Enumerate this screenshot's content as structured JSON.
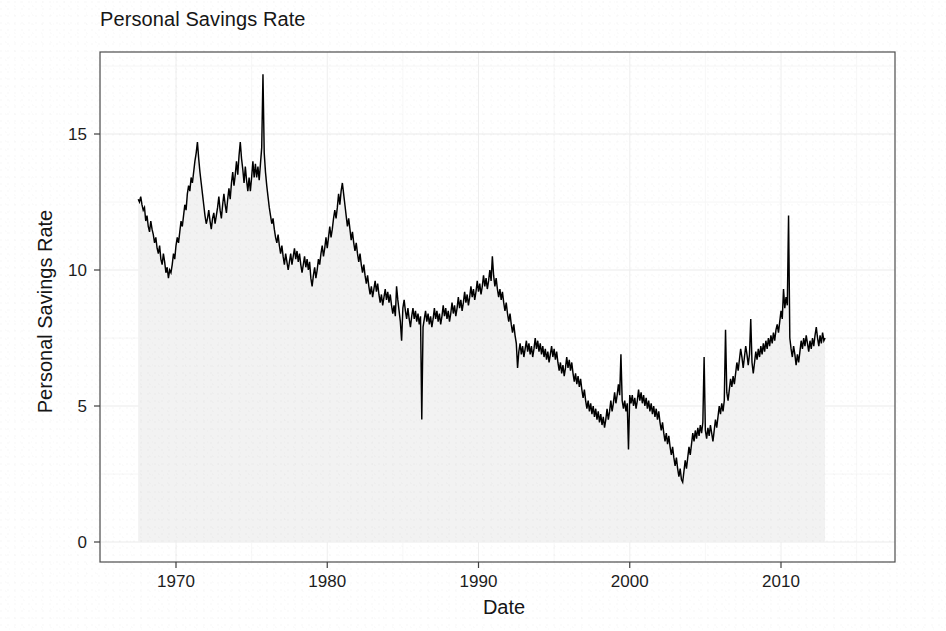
{
  "chart_data": {
    "type": "area",
    "title": "Personal Savings Rate",
    "xlabel": "Date",
    "ylabel": "Personal Savings Rate",
    "x_tick_labels": [
      "1970",
      "1980",
      "1990",
      "2000",
      "2010"
    ],
    "x_ticks": [
      1970,
      1980,
      1990,
      2000,
      2010
    ],
    "y_tick_labels": [
      "0",
      "5",
      "10",
      "15"
    ],
    "y_ticks": [
      0,
      5,
      10,
      15
    ],
    "xlim": [
      1966.6,
      2016.2
    ],
    "ylim": [
      -0.4,
      18.0
    ],
    "grid": true,
    "legend": "none",
    "line_color": "#000000",
    "fill_color": "#f2f2f2",
    "panel_border_color": "#4a4a4a",
    "series": [
      {
        "name": "Personal Savings Rate",
        "x_start": 1967.5,
        "x_end": 2015.42,
        "x_step": 0.0833333,
        "frequency": "monthly",
        "values": [
          12.6,
          12.5,
          12.7,
          12.4,
          12.2,
          12.3,
          11.8,
          12.0,
          11.6,
          11.4,
          11.8,
          11.5,
          11.3,
          11.0,
          11.2,
          10.8,
          10.6,
          10.9,
          10.4,
          10.2,
          10.6,
          10.3,
          9.9,
          10.1,
          9.7,
          10.0,
          9.9,
          10.2,
          10.6,
          10.4,
          10.9,
          11.2,
          11.0,
          11.4,
          11.8,
          11.6,
          12.0,
          12.4,
          12.2,
          12.8,
          13.1,
          12.9,
          13.4,
          13.2,
          13.6,
          14.0,
          14.3,
          14.7,
          14.1,
          13.6,
          13.2,
          12.8,
          12.4,
          12.0,
          11.7,
          11.9,
          12.2,
          11.8,
          11.5,
          11.9,
          12.1,
          11.7,
          12.0,
          12.3,
          12.7,
          12.2,
          11.9,
          12.4,
          12.8,
          12.4,
          12.1,
          12.6,
          13.0,
          12.6,
          13.2,
          13.6,
          13.1,
          13.5,
          14.0,
          13.5,
          14.2,
          14.7,
          14.1,
          13.7,
          13.2,
          13.8,
          13.3,
          12.9,
          13.4,
          12.9,
          13.4,
          14.0,
          13.4,
          13.9,
          13.4,
          13.8,
          13.3,
          13.9,
          14.5,
          17.2,
          14.3,
          13.6,
          13.1,
          12.7,
          12.3,
          12.0,
          11.7,
          11.9,
          11.5,
          11.2,
          11.0,
          11.3,
          10.9,
          10.6,
          10.9,
          10.5,
          10.2,
          10.6,
          10.3,
          10.0,
          10.3,
          10.6,
          10.2,
          10.5,
          10.8,
          10.4,
          10.7,
          10.3,
          10.6,
          10.2,
          9.9,
          10.2,
          10.5,
          10.1,
          10.4,
          10.0,
          10.3,
          9.7,
          9.4,
          9.8,
          10.1,
          9.7,
          10.0,
          10.4,
          10.2,
          10.6,
          10.9,
          10.5,
          10.8,
          11.2,
          10.8,
          11.2,
          11.6,
          11.2,
          11.5,
          11.9,
          12.2,
          11.9,
          12.3,
          12.8,
          12.4,
          12.9,
          13.2,
          12.8,
          12.4,
          12.0,
          11.6,
          11.9,
          11.5,
          11.1,
          11.4,
          11.0,
          10.7,
          11.0,
          10.6,
          10.3,
          10.6,
          10.2,
          9.9,
          10.2,
          9.8,
          9.5,
          9.8,
          9.4,
          9.1,
          9.4,
          9.0,
          9.3,
          9.6,
          9.2,
          9.5,
          9.1,
          8.8,
          9.1,
          8.7,
          9.0,
          9.3,
          8.9,
          9.2,
          8.8,
          9.1,
          8.7,
          8.4,
          8.7,
          8.3,
          9.4,
          8.9,
          8.5,
          8.1,
          7.4,
          8.6,
          8.9,
          8.5,
          8.2,
          8.6,
          8.2,
          7.9,
          8.3,
          8.6,
          8.2,
          8.5,
          8.1,
          8.4,
          8.0,
          8.3,
          4.5,
          7.9,
          8.2,
          8.5,
          8.1,
          8.4,
          8.0,
          8.3,
          7.9,
          8.2,
          8.6,
          8.2,
          8.5,
          8.1,
          8.4,
          8.0,
          8.3,
          8.7,
          8.3,
          8.6,
          8.2,
          8.5,
          8.1,
          8.4,
          8.8,
          8.4,
          8.7,
          8.3,
          8.6,
          9.0,
          8.6,
          8.9,
          8.5,
          8.8,
          9.2,
          8.8,
          9.1,
          8.7,
          9.0,
          9.4,
          9.0,
          9.3,
          8.9,
          9.2,
          9.6,
          9.2,
          9.5,
          9.1,
          9.4,
          9.8,
          9.4,
          9.7,
          9.3,
          9.6,
          10.0,
          9.6,
          10.5,
          9.8,
          9.4,
          9.7,
          9.3,
          9.0,
          9.3,
          8.9,
          9.2,
          8.8,
          8.5,
          8.8,
          8.4,
          8.1,
          8.4,
          8.0,
          7.7,
          8.0,
          7.6,
          7.3,
          6.4,
          7.0,
          7.3,
          6.9,
          7.2,
          6.8,
          7.1,
          7.4,
          7.0,
          7.3,
          6.9,
          7.2,
          6.8,
          7.1,
          7.5,
          7.1,
          7.4,
          7.0,
          7.3,
          6.9,
          7.2,
          6.8,
          7.1,
          6.7,
          7.0,
          6.6,
          6.9,
          7.2,
          6.8,
          7.1,
          6.7,
          7.0,
          6.6,
          6.3,
          6.6,
          6.2,
          6.5,
          6.1,
          6.4,
          6.8,
          6.4,
          6.7,
          6.3,
          6.6,
          6.2,
          5.9,
          6.2,
          5.8,
          6.1,
          5.7,
          6.0,
          5.6,
          5.3,
          5.6,
          5.2,
          4.9,
          5.2,
          4.8,
          5.1,
          4.7,
          5.0,
          4.6,
          4.9,
          4.5,
          4.8,
          4.4,
          4.7,
          4.3,
          4.6,
          4.2,
          4.5,
          4.9,
          4.5,
          4.8,
          5.2,
          4.8,
          5.1,
          5.5,
          5.1,
          5.4,
          5.8,
          5.4,
          6.9,
          5.2,
          4.9,
          5.2,
          4.8,
          5.1,
          3.4,
          5.4,
          5.1,
          5.4,
          5.0,
          5.3,
          4.9,
          5.2,
          5.6,
          5.2,
          5.5,
          5.1,
          5.4,
          5.0,
          5.3,
          4.9,
          5.2,
          4.8,
          5.1,
          4.7,
          5.0,
          4.6,
          4.9,
          4.5,
          4.8,
          4.4,
          4.1,
          4.4,
          4.0,
          3.7,
          4.0,
          3.6,
          3.9,
          3.5,
          3.2,
          3.5,
          3.1,
          2.8,
          3.1,
          2.7,
          2.4,
          2.7,
          2.3,
          2.2,
          2.6,
          3.0,
          2.7,
          3.1,
          3.5,
          3.2,
          3.6,
          4.0,
          3.7,
          4.1,
          3.8,
          4.2,
          3.9,
          4.3,
          4.0,
          4.4,
          6.8,
          4.1,
          3.8,
          4.2,
          3.9,
          4.3,
          4.0,
          3.7,
          4.1,
          4.5,
          4.2,
          4.6,
          5.0,
          4.7,
          5.1,
          4.8,
          5.2,
          7.8,
          5.5,
          5.2,
          5.6,
          6.0,
          5.7,
          6.1,
          5.8,
          6.2,
          6.6,
          6.3,
          6.7,
          7.1,
          6.8,
          6.4,
          6.8,
          7.2,
          6.9,
          6.5,
          6.9,
          8.2,
          6.6,
          6.2,
          6.6,
          7.0,
          6.7,
          7.1,
          6.8,
          7.2,
          6.9,
          7.3,
          7.0,
          7.4,
          7.1,
          7.5,
          7.2,
          7.6,
          7.3,
          7.7,
          7.4,
          7.8,
          8.0,
          7.7,
          8.1,
          8.5,
          8.2,
          9.3,
          8.6,
          9.0,
          8.7,
          12.0,
          7.5,
          7.1,
          6.8,
          7.2,
          6.9,
          6.5,
          6.9,
          6.6,
          7.0,
          7.4,
          7.1,
          7.5,
          7.2,
          7.6,
          7.3,
          7.0,
          7.4,
          7.1,
          7.5,
          7.2,
          7.6,
          7.9,
          7.5,
          7.2,
          7.6,
          7.3,
          7.7,
          7.4,
          7.5
        ]
      }
    ],
    "annotations": {
      "max_value": 17.2,
      "max_year": 1975,
      "min_value": 2.2,
      "min_year": 2005
    }
  }
}
